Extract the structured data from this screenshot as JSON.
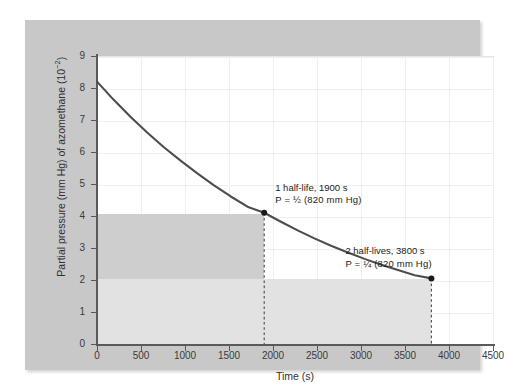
{
  "chart_data": {
    "type": "line",
    "title": "",
    "subtitle": "",
    "xlabel": "Time (s)",
    "ylabel": "Partial pressure (mm Hg) of azomethane (10⁻²)",
    "ylabel_main": "Partial pressure (mm Hg) of azomethane (10",
    "ylabel_exp": "−2",
    "ylabel_tail": ")",
    "xlim": [
      0,
      4500
    ],
    "ylim": [
      0,
      9
    ],
    "grid": true,
    "legend": "none",
    "x_ticks": [
      0,
      500,
      1000,
      1500,
      2000,
      2500,
      3000,
      3500,
      4000,
      4500
    ],
    "x_tick_labels": [
      "0",
      "500",
      "1000",
      "1500",
      "2000",
      "2500",
      "3000",
      "3500",
      "4000",
      "4500"
    ],
    "y_ticks": [
      0,
      1,
      2,
      3,
      4,
      5,
      6,
      7,
      8,
      9
    ],
    "y_tick_labels": [
      "0",
      "1",
      "2",
      "3",
      "4",
      "5",
      "6",
      "7",
      "8",
      "9"
    ],
    "series": [
      {
        "name": "azomethane partial pressure",
        "color": "#4d4d4d",
        "initial_value": 8.2,
        "half_life": 1900,
        "x": [
          0,
          190,
          380,
          570,
          760,
          950,
          1140,
          1330,
          1520,
          1710,
          1900,
          2090,
          2280,
          2470,
          2660,
          2850,
          3040,
          3230,
          3420,
          3610,
          3800
        ],
        "values": [
          8.2,
          7.63,
          7.1,
          6.61,
          6.15,
          5.73,
          5.33,
          4.96,
          4.61,
          4.29,
          4.1,
          3.82,
          3.55,
          3.3,
          3.07,
          2.86,
          2.66,
          2.48,
          2.31,
          2.15,
          2.05
        ]
      }
    ],
    "markers": [
      {
        "x": 1900,
        "y": 4.1,
        "label": "1 half-life point"
      },
      {
        "x": 3800,
        "y": 2.05,
        "label": "2 half-lives point"
      }
    ],
    "dashed_drop_lines": [
      {
        "x": 1900,
        "from_y": 4.1,
        "to_y": 0
      },
      {
        "x": 3800,
        "from_y": 2.05,
        "to_y": 0
      }
    ],
    "shaded_bands": [
      {
        "name": "dark-band",
        "x0": 0,
        "x1": 1900,
        "y0": 2.05,
        "y1": 4.1,
        "color": "#cdcdcd"
      },
      {
        "name": "light-band",
        "x0": 0,
        "x1": 3800,
        "y0": 0,
        "y1": 2.05,
        "color": "#e0e0e0"
      }
    ],
    "annotations": [
      {
        "name": "first-half-life",
        "line1": "1 half-life, 1900 s",
        "line2_prefix": "P = ",
        "line2_fraction": "½",
        "line2_suffix": " (820 mm Hg)",
        "x": 1900,
        "y": 4.1
      },
      {
        "name": "second-half-life",
        "line1": "2 half-lives, 3800 s",
        "line2_prefix": "P = ",
        "line2_fraction": "¼",
        "line2_suffix": " (820 mm Hg)",
        "x": 3800,
        "y": 2.05
      }
    ]
  },
  "colors": {
    "panel_background": "#c8c8c8",
    "plot_background": "#ffffff",
    "curve": "#4d4d4d",
    "axis": "#5a5a5a",
    "gridline": "#efefef",
    "band_dark": "#cdcdcd",
    "band_light": "#e0e0e0",
    "text": "#2f2f2f"
  }
}
